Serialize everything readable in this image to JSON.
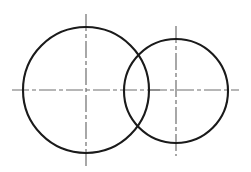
{
  "figure": {
    "type": "technical-line-drawing",
    "background_color": "#ffffff",
    "canvas": {
      "width": 251,
      "height": 172
    }
  },
  "styles": {
    "outline_color": "#1a1a1a",
    "outline_width": 2.1,
    "centerline_color": "#6e6e6e",
    "centerline_width": 1.2,
    "centerline_dash_pattern": "17 3 4 3"
  },
  "shapes": [
    {
      "name": "large-circle",
      "kind": "circle",
      "cx": 86,
      "cy": 90,
      "r": 63,
      "stroke": "#1a1a1a",
      "stroke_width": 2.1,
      "fill": "none"
    },
    {
      "name": "small-circle",
      "kind": "circle",
      "cx": 176,
      "cy": 91,
      "r": 52,
      "stroke": "#1a1a1a",
      "stroke_width": 2.1,
      "fill": "none"
    }
  ],
  "centerlines": [
    {
      "name": "large-circle-horizontal-centerline",
      "orientation": "horizontal",
      "x1": 12,
      "y1": 90,
      "x2": 160,
      "y2": 90
    },
    {
      "name": "large-circle-vertical-centerline",
      "orientation": "vertical",
      "x1": 86,
      "y1": 14,
      "x2": 86,
      "y2": 166
    },
    {
      "name": "small-circle-horizontal-centerline",
      "orientation": "horizontal",
      "x1": 150,
      "y1": 90,
      "x2": 239,
      "y2": 90
    },
    {
      "name": "small-circle-vertical-centerline",
      "orientation": "vertical",
      "x1": 176,
      "y1": 26,
      "x2": 176,
      "y2": 156
    }
  ],
  "center_marks": [
    {
      "name": "large-circle-center-point",
      "cx": 86,
      "cy": 90
    },
    {
      "name": "small-circle-center-point",
      "cx": 176,
      "cy": 91
    }
  ]
}
